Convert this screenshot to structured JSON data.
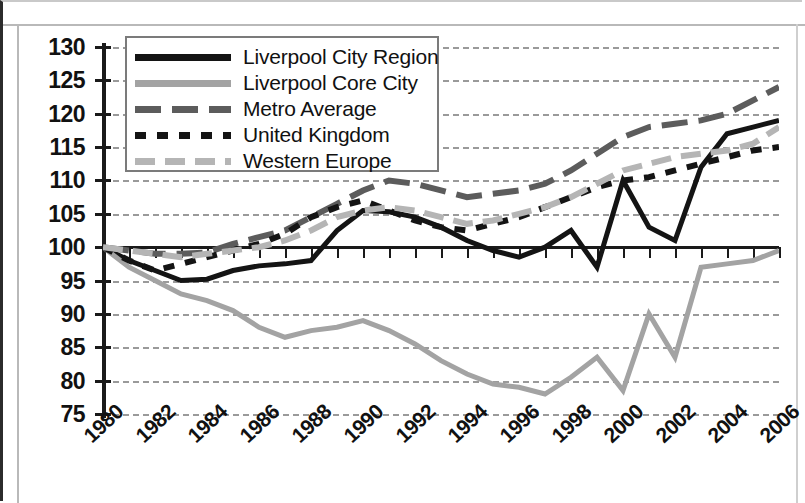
{
  "chart_data": {
    "type": "line",
    "title": "",
    "subtitle": "",
    "xlabel": "",
    "ylabel": "",
    "xlim": [
      1980,
      2006
    ],
    "ylim": [
      75,
      130
    ],
    "ytick_step": 5,
    "xtick_step": 1,
    "xlabel_step": 2,
    "grid": "horizontal-dashed",
    "legend_position": "top-left-inside",
    "index_base": 100,
    "x": [
      1980,
      1981,
      1982,
      1983,
      1984,
      1985,
      1986,
      1987,
      1988,
      1989,
      1990,
      1991,
      1992,
      1993,
      1994,
      1995,
      1996,
      1997,
      1998,
      1999,
      2000,
      2001,
      2002,
      2003,
      2004,
      2005,
      2006
    ],
    "xticklabels": [
      "1980",
      "1982",
      "1984",
      "1986",
      "1988",
      "1990",
      "1992",
      "1994",
      "1996",
      "1998",
      "2000",
      "2002",
      "2004",
      "2006"
    ],
    "yticklabels": [
      "75",
      "80",
      "85",
      "90",
      "95",
      "100",
      "105",
      "110",
      "115",
      "120",
      "125",
      "130"
    ],
    "series": [
      {
        "name": "Liverpool City Region",
        "style": "solid",
        "color": "#141414",
        "width": 5,
        "values": [
          100.0,
          98.0,
          96.5,
          95.0,
          95.2,
          96.5,
          97.2,
          97.5,
          98.0,
          102.5,
          105.5,
          105.3,
          104.5,
          103.0,
          101.0,
          99.5,
          98.5,
          100.0,
          102.5,
          97.0,
          110.0,
          103.0,
          101.0,
          112.0,
          117.0,
          118.0,
          119.0
        ]
      },
      {
        "name": "Liverpool Core City",
        "style": "solid",
        "color": "#a3a3a3",
        "width": 5,
        "values": [
          100.0,
          97.0,
          95.0,
          93.0,
          92.0,
          90.5,
          88.0,
          86.5,
          87.5,
          88.0,
          89.0,
          87.5,
          85.5,
          83.0,
          81.0,
          79.5,
          79.0,
          78.0,
          80.5,
          83.5,
          78.5,
          90.0,
          83.5,
          97.0,
          97.5,
          98.0,
          99.5
        ]
      },
      {
        "name": "Metro Average",
        "style": "long-dash",
        "color": "#5c5c5c",
        "width": 6,
        "values": [
          100.0,
          99.5,
          99.0,
          99.0,
          99.2,
          100.5,
          101.5,
          102.5,
          104.5,
          106.5,
          108.5,
          110.0,
          109.5,
          108.5,
          107.5,
          108.0,
          108.5,
          109.5,
          111.5,
          114.0,
          116.5,
          118.0,
          118.5,
          119.0,
          120.0,
          122.0,
          124.0
        ]
      },
      {
        "name": "United Kingdom",
        "style": "short-dash",
        "color": "#141414",
        "width": 6,
        "values": [
          100.0,
          98.0,
          96.5,
          97.5,
          98.5,
          99.5,
          100.5,
          102.0,
          104.5,
          106.0,
          107.0,
          105.5,
          104.0,
          103.0,
          102.5,
          103.5,
          104.5,
          106.0,
          107.5,
          109.0,
          110.0,
          110.5,
          111.5,
          112.5,
          113.5,
          114.5,
          115.0
        ]
      },
      {
        "name": "Western Europe",
        "style": "medium-dash",
        "color": "#b5b5b5",
        "width": 6,
        "values": [
          100.0,
          99.5,
          99.0,
          98.5,
          99.0,
          99.5,
          100.0,
          101.0,
          102.5,
          104.5,
          105.5,
          106.0,
          105.5,
          104.5,
          103.5,
          104.0,
          105.0,
          106.0,
          107.5,
          109.5,
          111.5,
          112.5,
          113.5,
          114.0,
          114.5,
          115.5,
          118.0
        ]
      }
    ]
  },
  "legend": {
    "entries": [
      {
        "label": "Liverpool City Region",
        "color": "#141414",
        "style": "solid"
      },
      {
        "label": "Liverpool Core City",
        "color": "#a3a3a3",
        "style": "solid"
      },
      {
        "label": "Metro Average",
        "color": "#5c5c5c",
        "style": "long-dash"
      },
      {
        "label": "United Kingdom",
        "color": "#141414",
        "style": "short-dash"
      },
      {
        "label": "Western Europe",
        "color": "#b5b5b5",
        "style": "medium-dash"
      }
    ]
  }
}
